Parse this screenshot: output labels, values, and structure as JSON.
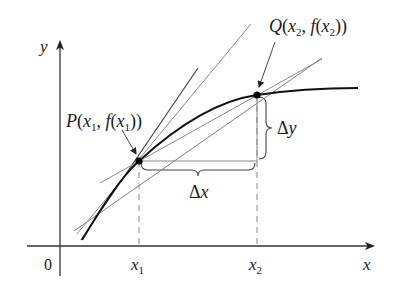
{
  "figure": {
    "axes": {
      "x_label": "x",
      "y_label": "y",
      "origin_label": "0"
    },
    "ticks": {
      "x1_label": "x",
      "x1_sub": "1",
      "x2_label": "x",
      "x2_sub": "2"
    },
    "points": {
      "P": {
        "name": "P",
        "coord_text_open": "(",
        "x_var": "x",
        "x_sub": "1",
        "sep": ", ",
        "fn": "f",
        "fn_open": "(",
        "fx_var": "x",
        "fx_sub": "1",
        "close": "))"
      },
      "Q": {
        "name": "Q",
        "coord_text_open": "(",
        "x_var": "x",
        "x_sub": "2",
        "sep": ", ",
        "fn": "f",
        "fn_open": "(",
        "fx_var": "x",
        "fx_sub": "2",
        "close": "))"
      }
    },
    "increments": {
      "delta_x_symbol": "Δ",
      "delta_x_var": "x",
      "delta_y_symbol": "Δ",
      "delta_y_var": "y"
    },
    "colors": {
      "curve": "#1a1a1a",
      "secant_lines": "#7a7a7a",
      "axes": "#333333",
      "dashed": "#888888",
      "points": "#000000"
    }
  }
}
